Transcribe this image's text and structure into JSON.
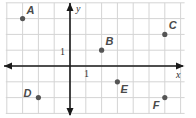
{
  "diagram": {
    "type": "coordinate-plane",
    "axes": {
      "x_label": "x",
      "y_label": "y",
      "unit_label_x": "1",
      "unit_label_y": "1"
    },
    "grid": {
      "x_min": -4,
      "x_max": 7,
      "y_min": -3,
      "y_max": 4
    },
    "points": [
      {
        "name": "A",
        "x": -3,
        "y": 3
      },
      {
        "name": "B",
        "x": 2,
        "y": 1
      },
      {
        "name": "C",
        "x": 6,
        "y": 2
      },
      {
        "name": "D",
        "x": -2,
        "y": -2
      },
      {
        "name": "E",
        "x": 3,
        "y": -1
      },
      {
        "name": "F",
        "x": 6,
        "y": -2
      }
    ],
    "colors": {
      "grid": "#d4d4d4",
      "axis": "#1a1a1a",
      "point": "#555555",
      "label": "#4a4a4a"
    }
  }
}
